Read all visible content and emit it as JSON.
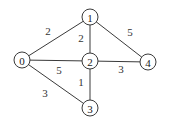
{
  "graph": {
    "nodes": [
      {
        "id": "0",
        "label": "0",
        "x": 22,
        "y": 60
      },
      {
        "id": "1",
        "label": "1",
        "x": 90,
        "y": 17
      },
      {
        "id": "2",
        "label": "2",
        "x": 90,
        "y": 61
      },
      {
        "id": "3",
        "label": "3",
        "x": 90,
        "y": 108
      },
      {
        "id": "4",
        "label": "4",
        "x": 148,
        "y": 62
      }
    ],
    "edges": [
      {
        "from": "0",
        "to": "1",
        "weight": "2",
        "label_x": 48,
        "label_y": 31
      },
      {
        "from": "0",
        "to": "2",
        "weight": "5",
        "label_x": 59,
        "label_y": 70
      },
      {
        "from": "0",
        "to": "3",
        "weight": "3",
        "label_x": 45,
        "label_y": 93
      },
      {
        "from": "1",
        "to": "2",
        "weight": "2",
        "label_x": 81,
        "label_y": 38
      },
      {
        "from": "1",
        "to": "4",
        "weight": "5",
        "label_x": 130,
        "label_y": 32
      },
      {
        "from": "2",
        "to": "3",
        "weight": "1",
        "label_x": 81,
        "label_y": 82
      },
      {
        "from": "2",
        "to": "4",
        "weight": "3",
        "label_x": 121,
        "label_y": 69
      }
    ],
    "node_radius": 8,
    "colors": {
      "stroke": "#3a3a3a",
      "fill": "#ffffff",
      "text": "#222222"
    }
  }
}
